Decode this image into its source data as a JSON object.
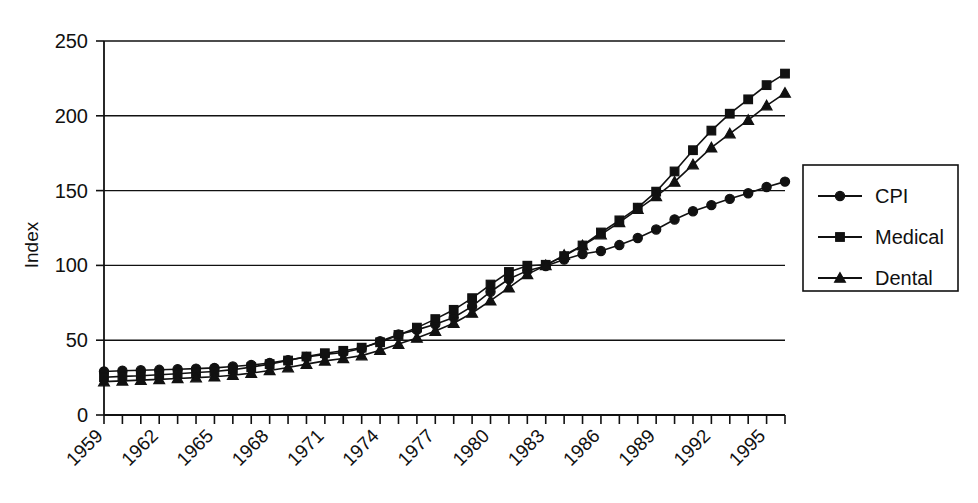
{
  "chart_data": {
    "type": "line",
    "title": "",
    "xlabel": "",
    "ylabel": "Index",
    "ylim": [
      0,
      250
    ],
    "yticks": [
      0,
      50,
      100,
      150,
      200,
      250
    ],
    "xlim": [
      1959,
      1996
    ],
    "xtick_labels": [
      "1959",
      "1962",
      "1965",
      "1968",
      "1971",
      "1974",
      "1977",
      "1980",
      "1983",
      "1986",
      "1989",
      "1992",
      "1995"
    ],
    "xtick_step_years": 3,
    "grid": "horizontal",
    "legend_position": "right-outside",
    "x": [
      1959,
      1960,
      1961,
      1962,
      1963,
      1964,
      1965,
      1966,
      1967,
      1968,
      1969,
      1970,
      1971,
      1972,
      1973,
      1974,
      1975,
      1976,
      1977,
      1978,
      1979,
      1980,
      1981,
      1982,
      1983,
      1984,
      1985,
      1986,
      1987,
      1988,
      1989,
      1990,
      1991,
      1992,
      1993,
      1994,
      1995,
      1996
    ],
    "series": [
      {
        "name": "CPI",
        "marker": "circle",
        "color": "#111111",
        "values": [
          29.1,
          29.6,
          29.9,
          30.2,
          30.6,
          31.0,
          31.5,
          32.4,
          33.4,
          34.8,
          36.7,
          38.8,
          40.5,
          41.8,
          44.4,
          49.3,
          53.8,
          56.9,
          60.6,
          65.2,
          72.6,
          82.4,
          90.9,
          96.5,
          99.6,
          103.9,
          107.6,
          109.6,
          113.6,
          118.3,
          124.0,
          130.7,
          136.2,
          140.3,
          144.5,
          148.2,
          152.4,
          156.0
        ]
      },
      {
        "name": "Medical",
        "marker": "square",
        "color": "#111111",
        "values": [
          25.2,
          25.8,
          26.2,
          26.9,
          27.6,
          28.4,
          29.1,
          30.3,
          32.0,
          34.0,
          36.4,
          39.1,
          41.3,
          42.9,
          45.0,
          48.6,
          53.5,
          58.4,
          64.1,
          70.3,
          78.1,
          87.2,
          95.6,
          99.8,
          100.4,
          106.2,
          113.3,
          122.0,
          130.1,
          138.6,
          149.3,
          162.8,
          177.0,
          190.1,
          201.4,
          211.0,
          220.5,
          228.2
        ]
      },
      {
        "name": "Dental",
        "marker": "triangle",
        "color": "#111111",
        "values": [
          22.3,
          22.8,
          23.3,
          23.8,
          24.4,
          25.0,
          25.6,
          26.6,
          28.0,
          29.8,
          31.7,
          34.0,
          36.2,
          37.8,
          39.7,
          43.3,
          47.4,
          51.5,
          56.1,
          61.3,
          68.2,
          76.4,
          85.1,
          94.0,
          100.0,
          106.9,
          113.3,
          120.6,
          128.8,
          137.5,
          146.1,
          155.8,
          167.4,
          178.7,
          188.1,
          197.1,
          206.8,
          215.2
        ]
      }
    ]
  },
  "legend": {
    "items": [
      {
        "label": "CPI"
      },
      {
        "label": "Medical"
      },
      {
        "label": "Dental"
      }
    ]
  },
  "axes": {
    "y_title": "Index",
    "y_tick_0": "0",
    "y_tick_50": "50",
    "y_tick_100": "100",
    "y_tick_150": "150",
    "y_tick_200": "200",
    "y_tick_250": "250"
  }
}
